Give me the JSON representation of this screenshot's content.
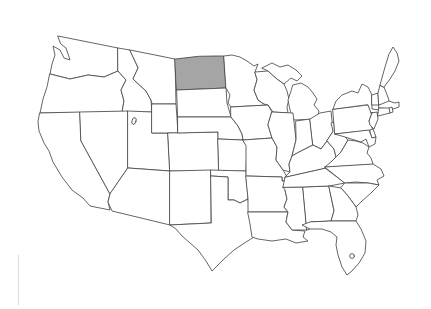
{
  "figure": {
    "type": "outline-map",
    "region": "Contiguous United States",
    "highlighted_state": "North Dakota",
    "states_drawn": 48,
    "colors": {
      "background": "#ffffff",
      "state_fill": "#ffffff",
      "border": "#4a4a4a",
      "highlight_fill": "#a5a5a5",
      "artifact_line": "#dcdcdc"
    }
  }
}
